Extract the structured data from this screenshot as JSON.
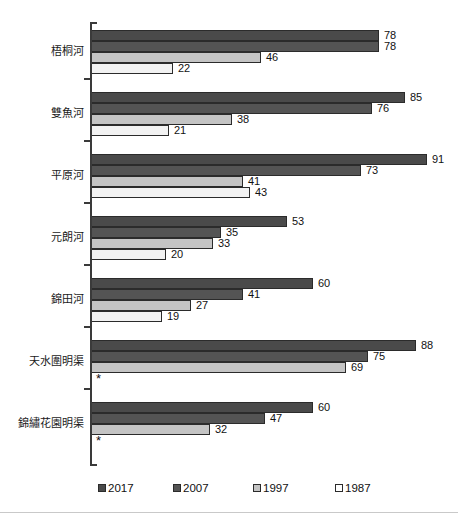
{
  "chart_data": {
    "type": "bar",
    "orientation": "horizontal",
    "title": "",
    "subtitle": "",
    "xlabel": "",
    "ylabel": "",
    "grid": false,
    "legend_position": "bottom",
    "xlim": [
      0,
      100
    ],
    "categories": [
      "梧桐河",
      "雙魚河",
      "平原河",
      "元朗河",
      "錦田河",
      "天水圍明渠",
      "錦繡花園明渠"
    ],
    "series": [
      {
        "name": "2017",
        "color": "#4a4a4a",
        "values": [
          78,
          85,
          91,
          53,
          60,
          88,
          60
        ]
      },
      {
        "name": "2007",
        "color": "#545454",
        "values": [
          78,
          76,
          73,
          35,
          41,
          75,
          47
        ]
      },
      {
        "name": "1997",
        "color": "#c4c4c4",
        "values": [
          46,
          38,
          41,
          33,
          27,
          69,
          32
        ]
      },
      {
        "name": "1987",
        "color": "#f2f2f2",
        "values": [
          22,
          21,
          43,
          20,
          19,
          null,
          null
        ]
      }
    ],
    "missing_value_marker": "*",
    "legend": [
      "2017",
      "2007",
      "1997",
      "1987"
    ]
  },
  "legend": {
    "items": [
      {
        "label": "2017"
      },
      {
        "label": "2007"
      },
      {
        "label": "1997"
      },
      {
        "label": "1987"
      }
    ]
  }
}
